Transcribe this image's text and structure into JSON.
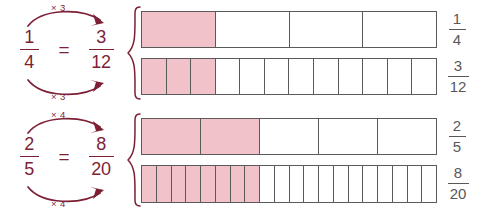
{
  "page": {
    "background": "#ffffff",
    "accent_maroon": "#7d1f35",
    "shade_pink": "#f2c2ca",
    "outline_gray": "#5a5a5a",
    "label_gray": "#58585a"
  },
  "equations": [
    {
      "id": "equation-one-quarter",
      "left": {
        "numerator": "1",
        "denominator": "4"
      },
      "equals": "=",
      "right": {
        "numerator": "3",
        "denominator": "12"
      },
      "top_arrow_label": "× 3",
      "bottom_arrow_label": "× 3"
    },
    {
      "id": "equation-two-fifths",
      "left": {
        "numerator": "2",
        "denominator": "5"
      },
      "equals": "=",
      "right": {
        "numerator": "8",
        "denominator": "20"
      },
      "top_arrow_label": "× 4",
      "bottom_arrow_label": "× 4"
    }
  ],
  "bar_models": [
    {
      "id": "bar-one-quarter",
      "total_parts": 4,
      "shaded_parts": 1,
      "label": {
        "numerator": "1",
        "denominator": "4"
      }
    },
    {
      "id": "bar-three-twelfths",
      "total_parts": 12,
      "shaded_parts": 3,
      "label": {
        "numerator": "3",
        "denominator": "12"
      }
    },
    {
      "id": "bar-two-fifths",
      "total_parts": 5,
      "shaded_parts": 2,
      "label": {
        "numerator": "2",
        "denominator": "5"
      }
    },
    {
      "id": "bar-eight-twentieths",
      "total_parts": 20,
      "shaded_parts": 8,
      "label": {
        "numerator": "8",
        "denominator": "20"
      }
    }
  ],
  "braces": [
    {
      "id": "brace-top",
      "groups": [
        "bar-one-quarter",
        "bar-three-twelfths"
      ]
    },
    {
      "id": "brace-bottom",
      "groups": [
        "bar-two-fifths",
        "bar-eight-twentieths"
      ]
    }
  ]
}
